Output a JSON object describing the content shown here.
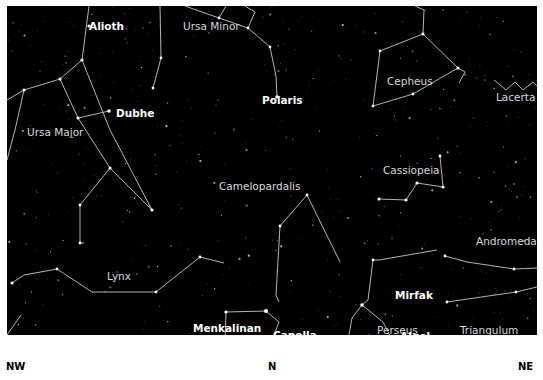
{
  "map": {
    "background": "#000000",
    "line_color": "#c8c8c8",
    "constellations": [
      {
        "name": "Ursa Minor",
        "x": 183,
        "y": 27
      },
      {
        "name": "Cepheus",
        "x": 387,
        "y": 82
      },
      {
        "name": "Lacerta",
        "x": 496,
        "y": 98
      },
      {
        "name": "Ursa Major",
        "x": 27,
        "y": 133
      },
      {
        "name": "Camelopardalis",
        "x": 219,
        "y": 187
      },
      {
        "name": "Cassiopeia",
        "x": 383,
        "y": 171
      },
      {
        "name": "Andromeda",
        "x": 476,
        "y": 242
      },
      {
        "name": "Lynx",
        "x": 107,
        "y": 277
      },
      {
        "name": "Auriga",
        "x": 187,
        "y": 345
      },
      {
        "name": "Perseus",
        "x": 377,
        "y": 331
      },
      {
        "name": "Triangulum",
        "x": 460,
        "y": 331
      }
    ],
    "stars": [
      {
        "name": "Alioth",
        "x": 89,
        "y": 27
      },
      {
        "name": "Dubhe",
        "x": 116,
        "y": 114
      },
      {
        "name": "Polaris",
        "x": 262,
        "y": 101
      },
      {
        "name": "Mirfak",
        "x": 395,
        "y": 296
      },
      {
        "name": "Menkalinan",
        "x": 193,
        "y": 329
      },
      {
        "name": "Capella",
        "x": 273,
        "y": 336
      },
      {
        "name": "Algol",
        "x": 400,
        "y": 337
      }
    ],
    "directions": [
      {
        "label": "NW",
        "x": 6
      },
      {
        "label": "N",
        "x": 268
      },
      {
        "label": "NE",
        "x": 518
      }
    ]
  }
}
